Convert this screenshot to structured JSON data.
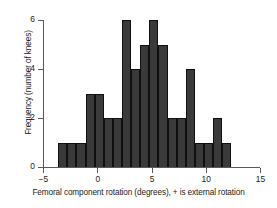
{
  "chart_data": {
    "type": "bar",
    "title": "",
    "subtitle": "",
    "xlabel": "Femoral component rotation (degrees), + is external rotation",
    "ylabel": "Frequency (number of knees)",
    "xlim": [
      -5,
      15
    ],
    "ylim": [
      0,
      6
    ],
    "xticks": [
      -5,
      0,
      5,
      10,
      15
    ],
    "xtick_labels": [
      "−5",
      "0",
      "5",
      "10",
      "15"
    ],
    "yticks": [
      0,
      2,
      4,
      6
    ],
    "ytick_labels": [
      "0",
      "2",
      "4",
      "6"
    ],
    "grid": false,
    "legend": false,
    "bar_color": "#3a3a3a",
    "bar_edge_color": "#101010",
    "bin_width": 0.84,
    "bin_starts": [
      -3.6,
      -2.76,
      -1.92,
      -1.08,
      -0.24,
      0.6,
      1.44,
      2.28,
      3.12,
      3.96,
      4.8,
      5.64,
      6.48,
      7.32,
      8.16,
      9.0,
      9.84,
      10.68,
      11.52
    ],
    "bin_centers": [
      -3.18,
      -2.34,
      -1.5,
      -0.66,
      0.18,
      1.02,
      1.86,
      2.7,
      3.54,
      4.38,
      5.22,
      6.06,
      6.9,
      7.74,
      8.58,
      9.42,
      10.26,
      11.1,
      11.94
    ],
    "categories": [
      "-3.6",
      "-2.8",
      "-1.9",
      "-1.1",
      "-0.2",
      "0.6",
      "1.4",
      "2.3",
      "3.1",
      "4.0",
      "4.8",
      "5.6",
      "6.5",
      "7.3",
      "8.2",
      "9.0",
      "9.8",
      "10.7",
      "11.5"
    ],
    "values": [
      1,
      1,
      1,
      3,
      3,
      2,
      2,
      6,
      4,
      5,
      6,
      5,
      2,
      2,
      4,
      1,
      1,
      2,
      1
    ]
  }
}
